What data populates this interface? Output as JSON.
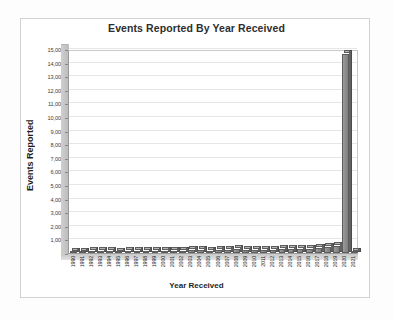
{
  "chart_data": {
    "type": "bar",
    "title": "Events Reported By Year Received",
    "xlabel": "Year Received",
    "ylabel": "Events Reported",
    "ylim": [
      0,
      15000
    ],
    "ytick_step": 1000,
    "grid": true,
    "legend": false,
    "style": "3d-bar-grayscale",
    "categories": [
      "1990",
      "1991",
      "1992",
      "1993",
      "1994",
      "1995",
      "1996",
      "1997",
      "1998",
      "1999",
      "2000",
      "2001",
      "2002",
      "2003",
      "2004",
      "2005",
      "2006",
      "2007",
      "2008",
      "2009",
      "2010",
      "2011",
      "2012",
      "2013",
      "2014",
      "2015",
      "2016",
      "2017",
      "2018",
      "2019",
      "2020",
      "2021"
    ],
    "values": [
      60,
      110,
      150,
      170,
      160,
      90,
      130,
      150,
      160,
      170,
      180,
      170,
      175,
      195,
      185,
      180,
      200,
      215,
      260,
      255,
      245,
      250,
      255,
      270,
      285,
      300,
      320,
      370,
      420,
      480,
      14600,
      30
    ],
    "ytick_labels": [
      "0",
      "1,000",
      "2,000",
      "3,000",
      "4,000",
      "5,000",
      "6,000",
      "7,000",
      "8,000",
      "9,000",
      "10,000",
      "11,000",
      "12,000",
      "13,000",
      "14,000",
      "15,000"
    ],
    "ytick_values": [
      0,
      1000,
      2000,
      3000,
      4000,
      5000,
      6000,
      7000,
      8000,
      9000,
      10000,
      11000,
      12000,
      13000,
      14000,
      15000
    ],
    "colors": {
      "bar_front": "#8f8f8f",
      "bar_side": "#636363",
      "bar_top": "#b4b4b4",
      "bar_outline": "#5d5d5d",
      "gridline": "#e6e6ea",
      "axis": "#9a9a9a",
      "wall": "#c4c4c4",
      "plot_background": "#ffffff",
      "page_background": "#fdfdfd",
      "frame_border": "#d2d2d2",
      "title_text": "#2e2e2e",
      "tick_text": "#3a3a3a"
    }
  }
}
